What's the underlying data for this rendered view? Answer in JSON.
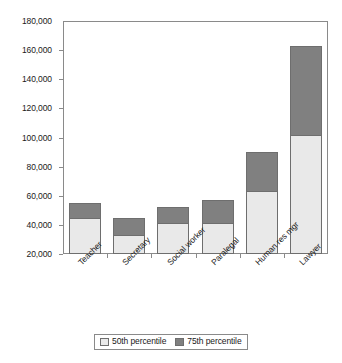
{
  "chart_data": {
    "type": "bar",
    "subtype": "stacked-vertical",
    "title": "",
    "xlabel": "",
    "ylabel": "",
    "categories": [
      "Teacher",
      "Secretary",
      "Social worker",
      "Paralegal",
      "Human res mgr",
      "Lawyer"
    ],
    "series": [
      {
        "name": "50th percentile",
        "color": "#e9e9e9",
        "values": [
          45000,
          33000,
          41000,
          41000,
          63000,
          102000
        ]
      },
      {
        "name": "75th percentile",
        "color": "#808080",
        "values": [
          10000,
          12000,
          11000,
          16000,
          27000,
          61000
        ]
      }
    ],
    "stack_totals": [
      55000,
      45000,
      52000,
      57000,
      90000,
      163000
    ],
    "ylim": [
      20000,
      180000
    ],
    "ytick_labels": [
      "180,000",
      "160,000",
      "140,000",
      "120,000",
      "100,000",
      "80,000",
      "60,000",
      "40,000",
      "20,000"
    ],
    "ytick_values": [
      180000,
      160000,
      140000,
      120000,
      100000,
      80000,
      60000,
      40000,
      20000
    ],
    "grid": false,
    "legend_position": "bottom",
    "legend_entries": [
      "50th percentile",
      "75th percentile"
    ],
    "xtick_label_rotation": -45
  }
}
